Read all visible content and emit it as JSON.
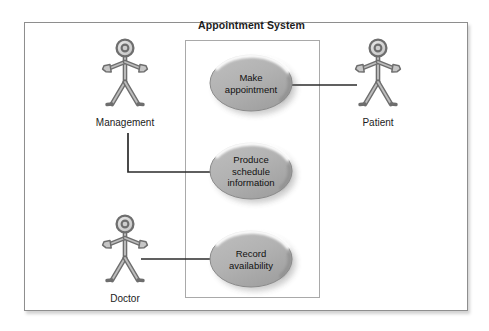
{
  "diagram": {
    "kind": "uml-use-case-diagram",
    "system_title": "Appointment System",
    "frame": {
      "x": 24,
      "y": 22,
      "width": 442,
      "height": 287
    },
    "system_boundary": {
      "x": 185,
      "y": 40,
      "width": 133,
      "height": 256
    },
    "colors": {
      "ellipse_fill": "#b2b2b2",
      "ellipse_fill_dark": "#9a9a9a",
      "ellipse_highlight": "#ffffff",
      "ellipse_stroke": "#8a8a8a",
      "actor_stroke": "#6e6e6e",
      "actor_fill": "#d0d0d0",
      "line": "#2b2b2b",
      "frame_border": "#8e8e8e",
      "boundary_border": "#a9a9a9",
      "text": "#111111",
      "background": "#ffffff"
    },
    "use_cases": [
      {
        "id": "make-appointment",
        "label": "Make\nappointment",
        "lines": [
          "Make",
          "appointment"
        ],
        "cx": 251,
        "cy": 83,
        "rx": 41,
        "ry": 28
      },
      {
        "id": "produce-schedule-information",
        "label": "Produce\nschedule\ninformation",
        "lines": [
          "Produce",
          "schedule",
          "information"
        ],
        "cx": 251,
        "cy": 171,
        "rx": 41,
        "ry": 28
      },
      {
        "id": "record-availability",
        "label": "Record\navailability",
        "lines": [
          "Record",
          "availability"
        ],
        "cx": 251,
        "cy": 259,
        "rx": 41,
        "ry": 28
      }
    ],
    "actors": [
      {
        "id": "management",
        "label": "Management",
        "cx": 125,
        "top": 48,
        "label_y": 117
      },
      {
        "id": "patient",
        "label": "Patient",
        "cx": 378,
        "top": 48,
        "label_y": 117
      },
      {
        "id": "doctor",
        "label": "Doctor",
        "cx": 125,
        "top": 224,
        "label_y": 293
      }
    ],
    "associations": [
      {
        "id": "patient-make-appointment",
        "from": "make-appointment",
        "to": "patient",
        "points": "292,85 357,85"
      },
      {
        "id": "management-produce-schedule-information",
        "from": "management",
        "to": "produce-schedule-information",
        "points": "128,133 128,172 211,172"
      },
      {
        "id": "doctor-record-availability",
        "from": "doctor",
        "to": "record-availability",
        "points": "141,259 211,259"
      }
    ]
  }
}
